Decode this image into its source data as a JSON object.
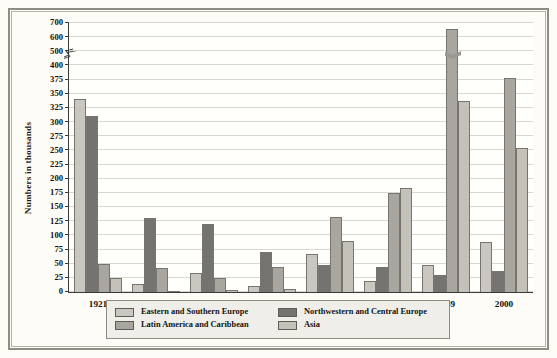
{
  "chart_data": {
    "type": "bar",
    "title": "",
    "xlabel": "",
    "ylabel": "Numbers in thousands",
    "categories": [
      "1921",
      "1925",
      "1930",
      "1953",
      "1970",
      "1979",
      "1989",
      "2000"
    ],
    "series": [
      {
        "name": "Eastern and Southern Europe",
        "color": "#c9c7bf",
        "values": [
          340,
          14,
          33,
          10,
          67,
          19,
          48,
          88
        ]
      },
      {
        "name": "Northwestern and Central Europe",
        "color": "#757370",
        "values": [
          310,
          130,
          120,
          70,
          47,
          44,
          30,
          37
        ]
      },
      {
        "name": "Latin America and Caribbean",
        "color": "#a8a69e",
        "values": [
          50,
          43,
          24,
          44,
          133,
          174,
          655,
          378
        ]
      },
      {
        "name": "Asia",
        "color": "#c4c2b8",
        "values": [
          25,
          2,
          3,
          6,
          90,
          184,
          338,
          255
        ]
      }
    ],
    "ytick_labels": [
      "0",
      "25",
      "50",
      "75",
      "100",
      "125",
      "150",
      "175",
      "200",
      "225",
      "250",
      "275",
      "300",
      "325",
      "350",
      "375",
      "400",
      "500",
      "600",
      "700"
    ],
    "ytick_values": [
      0,
      25,
      50,
      75,
      100,
      125,
      150,
      175,
      200,
      225,
      250,
      275,
      300,
      325,
      350,
      375,
      400,
      500,
      600,
      700
    ],
    "ylim": [
      0,
      700
    ],
    "axis_break": {
      "present": true,
      "between": [
        400,
        500
      ],
      "note": "y-axis scale is broken above 400"
    },
    "bar_break_marker": {
      "series": "Latin America and Caribbean",
      "category": "1989"
    },
    "grid": true,
    "legend_position": "bottom-center"
  },
  "legend": {
    "entries": [
      {
        "label": "Eastern and Southern Europe",
        "color": "#c9c7bf"
      },
      {
        "label": "Northwestern and Central Europe",
        "color": "#757370"
      },
      {
        "label": "Latin America and Caribbean",
        "color": "#a8a69e"
      },
      {
        "label": "Asia",
        "color": "#c4c2b8"
      }
    ]
  },
  "axes": {
    "y_title": "Numbers in thousands"
  }
}
